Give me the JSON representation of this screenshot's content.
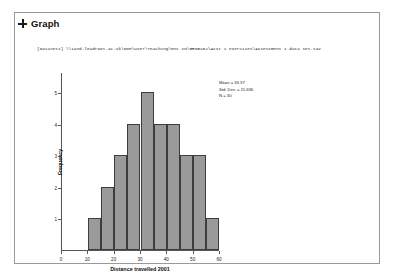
{
  "panel": {
    "title": "Graph",
    "expander_icon": "plus-expander-icon",
    "dataset_path": "[DataSet1] \\\\iand.leadroot.ac.uk\\DOM\\User\\Teaching\\MSc IO\\GEOG102\\Asst 1 exercises\\Assessment 1 data set.sav"
  },
  "chart_data": {
    "type": "bar",
    "title": "",
    "xlabel": "Distance travelled 2001",
    "ylabel": "Frequency",
    "categories": [
      "0-5",
      "5-10",
      "10-15",
      "15-20",
      "20-25",
      "25-30",
      "30-35",
      "35-40",
      "40-45",
      "45-50"
    ],
    "bin_centers": [
      12.5,
      17.5,
      22.5,
      25.5,
      30.5,
      33.5,
      37.5,
      41.5,
      45.5,
      50.5
    ],
    "values": [
      1,
      2,
      3,
      4,
      5,
      4,
      4,
      3,
      3,
      1
    ],
    "xlim": [
      0,
      60
    ],
    "ylim": [
      0,
      5.6
    ],
    "xticks": [
      0,
      10,
      20,
      30,
      40,
      50,
      60
    ],
    "xtick_labels": [
      "0",
      "10",
      "20",
      "30",
      "40",
      "50",
      "60"
    ],
    "yticks": [
      1,
      2,
      3,
      4,
      5
    ],
    "ytick_labels": [
      "1",
      "2",
      "3",
      "4",
      "5"
    ],
    "grid": false,
    "legend_position": "right",
    "bar_color": "#9a9a9a",
    "bar_edge_color": "#3d3d3d"
  },
  "statistics": {
    "mean_label": "Mean = 33.37",
    "std_dev_label": "Std. Dev. = 11.636",
    "n_label": "N = 30"
  }
}
